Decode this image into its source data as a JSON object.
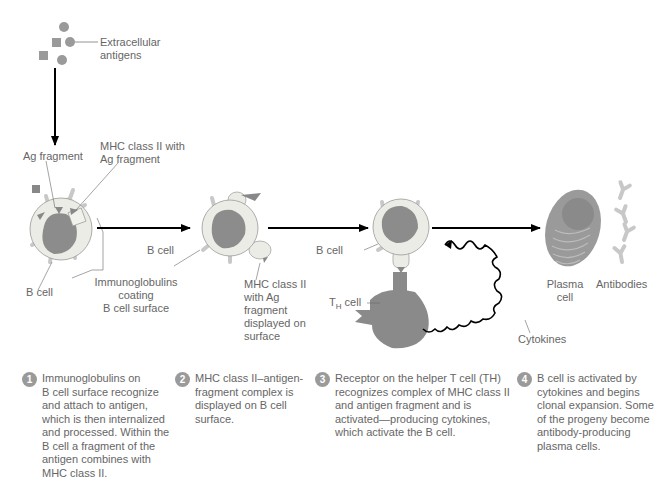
{
  "labels": {
    "extracellular_antigens": "Extracellular\nantigens",
    "ag_fragment": "Ag fragment",
    "mhc_with_ag": "MHC class II with\nAg fragment",
    "b_cell_1": "B cell",
    "immunoglobulins": "Immunoglobulins\ncoating\nB cell surface",
    "b_cell_2": "B cell",
    "mhc_displayed": "MHC class II\nwith Ag\nfragment\ndisplayed on\nsurface",
    "b_cell_3": "B cell",
    "th_cell_prefix": "T",
    "th_cell_sub": "H",
    "th_cell_suffix": " cell",
    "cytokines": "Cytokines",
    "plasma_cell": "Plasma\ncell",
    "antibodies": "Antibodies"
  },
  "steps": [
    {
      "num": "1",
      "text": "Immunoglobulins on\nB cell surface recognize\nand attach to antigen,\nwhich is then internalized\nand processed. Within the\nB cell a fragment of the\nantigen combines with\nMHC class II."
    },
    {
      "num": "2",
      "text": "MHC class II–antigen-\nfragment complex is\ndisplayed on B cell\nsurface."
    },
    {
      "num": "3",
      "text": "Receptor on the helper T cell (TH)\nrecognizes complex of MHC class II\nand antigen fragment and is\nactivated—producing cytokines,\nwhich activate the B cell."
    },
    {
      "num": "4",
      "text": "B cell is activated by\ncytokines and begins\nclonal expansion. Some\nof the progeny become\nantibody-producing\nplasma cells."
    }
  ],
  "colors": {
    "cell_body": "#ecece6",
    "nucleus": "#8c8c8c",
    "th_cell": "#8a8a8a",
    "antibody": "#c8c8c8",
    "antigen": "#9a9a9a",
    "arrow": "#000000",
    "text": "#666666"
  }
}
